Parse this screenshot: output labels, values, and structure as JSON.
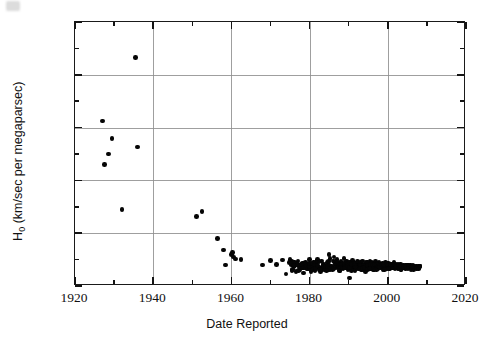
{
  "figure": {
    "background": "#ffffff",
    "frame_color": "#1a1a1a",
    "grid_color": "#8e8e8e",
    "marker_color": "#050505"
  },
  "axis_titles": {
    "x": "Date Reported",
    "y_prefix": "H",
    "y_sub": "0",
    "y_suffix": " (km/sec per megaparsec)",
    "y_full": "H0 (km/sec per megaparsec)"
  },
  "chart_data": {
    "type": "scatter",
    "title": "",
    "xlabel": "Date Reported",
    "ylabel": "H0 (km/sec per megaparsec)",
    "xlim": [
      1920,
      2020
    ],
    "ylim": [
      0,
      1000
    ],
    "xticks": [
      1920,
      1940,
      1960,
      1980,
      2000,
      2020
    ],
    "xtick_labels": [
      "1920",
      "1940",
      "1960",
      "1980",
      "2000",
      "2020"
    ],
    "xminor_step": 10,
    "yticks": [
      0,
      200,
      400,
      600,
      800,
      1000
    ],
    "ytick_labels": [
      "0",
      "200",
      "400",
      "600",
      "800",
      "1000"
    ],
    "yminor_step": 100,
    "grid": true,
    "grid_axes": "both-major",
    "legend": null,
    "marker": "filled-circle",
    "marker_size_px": 4.6,
    "series": [
      {
        "name": "Hubble constant measurements",
        "points": [
          [
            1927,
            625
          ],
          [
            1927.6,
            460
          ],
          [
            1928.5,
            500
          ],
          [
            1929.5,
            558
          ],
          [
            1932,
            290
          ],
          [
            1935.5,
            865
          ],
          [
            1936,
            526
          ],
          [
            1951,
            263
          ],
          [
            1952.5,
            282
          ],
          [
            1956.5,
            180
          ],
          [
            1958,
            136
          ],
          [
            1958.5,
            80
          ],
          [
            1960,
            120
          ],
          [
            1960.3,
            128
          ],
          [
            1960.6,
            110
          ],
          [
            1961,
            103
          ],
          [
            1962.5,
            100
          ],
          [
            1968,
            80
          ],
          [
            1970,
            97
          ],
          [
            1971.5,
            82
          ],
          [
            1973,
            98
          ],
          [
            1974,
            45
          ],
          [
            1975,
            100
          ],
          [
            1975.5,
            58
          ],
          [
            1976,
            72
          ],
          [
            1976.5,
            55
          ],
          [
            1977,
            95
          ],
          [
            1977.5,
            63
          ],
          [
            1978,
            78
          ],
          [
            1978.5,
            50
          ],
          [
            1979,
            88
          ],
          [
            1979.5,
            67
          ],
          [
            1980,
            100
          ],
          [
            1980.4,
            55
          ],
          [
            1980.8,
            74
          ],
          [
            1981,
            90
          ],
          [
            1981.4,
            62
          ],
          [
            1981.8,
            80
          ],
          [
            1982,
            100
          ],
          [
            1982.4,
            70
          ],
          [
            1982.8,
            55
          ],
          [
            1983,
            95
          ],
          [
            1983.3,
            66
          ],
          [
            1983.6,
            84
          ],
          [
            1984,
            72
          ],
          [
            1984.3,
            58
          ],
          [
            1984.6,
            90
          ],
          [
            1985,
            120
          ],
          [
            1985.2,
            105
          ],
          [
            1985.5,
            75
          ],
          [
            1985.8,
            62
          ],
          [
            1986,
            95
          ],
          [
            1986.2,
            110
          ],
          [
            1986.5,
            80
          ],
          [
            1986.8,
            68
          ],
          [
            1987,
            100
          ],
          [
            1987.2,
            86
          ],
          [
            1987.5,
            72
          ],
          [
            1987.8,
            58
          ],
          [
            1988,
            92
          ],
          [
            1988.2,
            78
          ],
          [
            1988.5,
            66
          ],
          [
            1988.8,
            104
          ],
          [
            1989,
            85
          ],
          [
            1989.2,
            70
          ],
          [
            1989.5,
            95
          ],
          [
            1989.8,
            60
          ],
          [
            1990,
            80
          ],
          [
            1990.2,
            30
          ],
          [
            1990.4,
            88
          ],
          [
            1990.6,
            72
          ],
          [
            1990.8,
            65
          ],
          [
            1991,
            96
          ],
          [
            1991.2,
            80
          ],
          [
            1991.4,
            70
          ],
          [
            1991.6,
            58
          ],
          [
            1991.8,
            86
          ],
          [
            1992,
            75
          ],
          [
            1992.2,
            92
          ],
          [
            1992.4,
            66
          ],
          [
            1992.6,
            80
          ],
          [
            1992.8,
            70
          ],
          [
            1993,
            88
          ],
          [
            1993.2,
            60
          ],
          [
            1993.4,
            78
          ],
          [
            1993.6,
            95
          ],
          [
            1993.8,
            72
          ],
          [
            1994,
            82
          ],
          [
            1994.2,
            68
          ],
          [
            1994.4,
            90
          ],
          [
            1994.6,
            75
          ],
          [
            1994.8,
            62
          ],
          [
            1995,
            85
          ],
          [
            1995.2,
            73
          ],
          [
            1995.4,
            95
          ],
          [
            1995.6,
            66
          ],
          [
            1995.8,
            80
          ],
          [
            1996,
            88
          ],
          [
            1996.2,
            72
          ],
          [
            1996.4,
            60
          ],
          [
            1996.6,
            78
          ],
          [
            1996.8,
            92
          ],
          [
            1997,
            70
          ],
          [
            1997.2,
            84
          ],
          [
            1997.4,
            64
          ],
          [
            1997.6,
            76
          ],
          [
            1997.8,
            90
          ],
          [
            1998,
            68
          ],
          [
            1998.2,
            80
          ],
          [
            1998.4,
            72
          ],
          [
            1998.6,
            86
          ],
          [
            1998.8,
            62
          ],
          [
            1999,
            78
          ],
          [
            1999.2,
            70
          ],
          [
            1999.4,
            88
          ],
          [
            1999.6,
            66
          ],
          [
            1999.8,
            80
          ],
          [
            2000,
            74
          ],
          [
            2000.2,
            85
          ],
          [
            2000.4,
            65
          ],
          [
            2000.6,
            78
          ],
          [
            2000.8,
            70
          ],
          [
            2001,
            82
          ],
          [
            2001.2,
            68
          ],
          [
            2001.4,
            76
          ],
          [
            2001.6,
            88
          ],
          [
            2001.8,
            64
          ],
          [
            2002,
            75
          ],
          [
            2002.2,
            70
          ],
          [
            2002.4,
            80
          ],
          [
            2002.6,
            66
          ],
          [
            2002.8,
            78
          ],
          [
            2003,
            72
          ],
          [
            2003.2,
            84
          ],
          [
            2003.4,
            62
          ],
          [
            2003.6,
            74
          ],
          [
            2003.8,
            68
          ],
          [
            2004,
            80
          ],
          [
            2004.2,
            70
          ],
          [
            2004.4,
            76
          ],
          [
            2004.6,
            66
          ],
          [
            2004.8,
            72
          ],
          [
            2005,
            78
          ],
          [
            2005.2,
            68
          ],
          [
            2005.4,
            74
          ],
          [
            2005.6,
            70
          ],
          [
            2005.8,
            80
          ],
          [
            2006,
            72
          ],
          [
            2006.2,
            66
          ],
          [
            2006.4,
            76
          ],
          [
            2006.6,
            70
          ],
          [
            2006.8,
            74
          ],
          [
            2007,
            68
          ],
          [
            2007.2,
            72
          ],
          [
            2007.4,
            76
          ],
          [
            2007.6,
            70
          ],
          [
            2007.8,
            73
          ],
          [
            2008,
            71
          ],
          [
            2008.2,
            74
          ]
        ],
        "extra_cluster": {
          "comment_free_count": 230,
          "x_range": [
            1975,
            2008
          ],
          "y_range": [
            48,
            108
          ]
        }
      }
    ]
  }
}
